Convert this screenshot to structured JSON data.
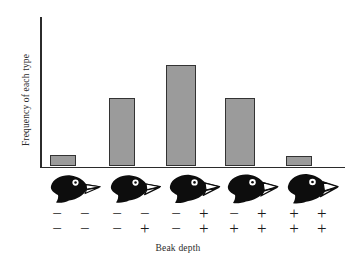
{
  "chart_data": {
    "type": "bar",
    "title": "",
    "xlabel": "Beak depth",
    "ylabel": "Frequency of each type",
    "grid": false,
    "legend": null,
    "axis_ticks": {
      "x": [],
      "y": []
    },
    "ylim": [
      0,
      100
    ],
    "categories": [
      "- - / - -",
      "- - / - +",
      "- + / - +",
      "- + / + +",
      "+ + / + +"
    ],
    "values": [
      8,
      46,
      68,
      46,
      7
    ],
    "bar_color": "#9b9b9b",
    "bar_border_color": "#333333",
    "axis_color": "#2b2b2b",
    "categories_detail": [
      {
        "id": "genotype-1",
        "top_row": "− −",
        "bottom_row": "− −",
        "bird_icon": "finch-head-icon",
        "beak_size": "smallest",
        "value": 8
      },
      {
        "id": "genotype-2",
        "top_row": "− −",
        "bottom_row": "− +",
        "bird_icon": "finch-head-icon",
        "beak_size": "small",
        "value": 46
      },
      {
        "id": "genotype-3",
        "top_row": "− +",
        "bottom_row": "− +",
        "bird_icon": "finch-head-icon",
        "beak_size": "medium",
        "value": 68
      },
      {
        "id": "genotype-4",
        "top_row": "− +",
        "bottom_row": "+ +",
        "bird_icon": "finch-head-icon",
        "beak_size": "large",
        "value": 46
      },
      {
        "id": "genotype-5",
        "top_row": "+ +",
        "bottom_row": "+ +",
        "bird_icon": "finch-head-icon",
        "beak_size": "largest",
        "value": 7
      }
    ]
  },
  "figure": {
    "ylabel": "Frequency of each type",
    "xlabel": "Beak depth"
  }
}
